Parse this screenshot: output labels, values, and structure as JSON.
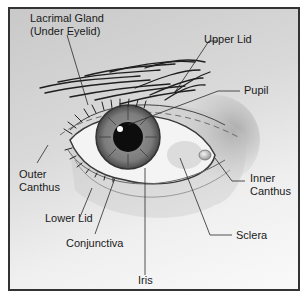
{
  "diagram": {
    "labels": {
      "lacrimal_gland": [
        "Lacrimal Gland",
        "(Under Eyelid)"
      ],
      "upper_lid": "Upper Lid",
      "pupil": "Pupil",
      "outer_canthus": [
        "Outer",
        "Canthus"
      ],
      "inner_canthus": [
        "Inner",
        "Canthus"
      ],
      "lower_lid": "Lower Lid",
      "conjunctiva": "Conjunctiva",
      "sclera": "Sclera",
      "iris": "Iris"
    },
    "colors": {
      "frame_border": "#333333",
      "background_light": "#fafafa",
      "background_dark": "#c9c9c9",
      "iris": "#7a7a7a",
      "pupil": "#0d0d0d",
      "sclera": "#f4f4f4",
      "leader_line": "#2a2a2a"
    }
  }
}
